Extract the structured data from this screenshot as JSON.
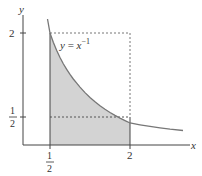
{
  "figure": {
    "axes": {
      "x_label": "x",
      "y_label": "y"
    },
    "curve": {
      "equation_lhs": "y",
      "equation_eq": " = ",
      "equation_base": "x",
      "equation_exp": "−1",
      "function": "y = 1/x",
      "domain": [
        0.45,
        3.0
      ]
    },
    "shaded_region": {
      "x_from": 0.5,
      "x_to": 2,
      "description": "area under y = 1/x from x = 1/2 to x = 2"
    },
    "dashed_rectangle": {
      "x_from": 0.5,
      "x_to": 2,
      "y_top": 2,
      "y_mid": 0.5
    },
    "x_ticks": [
      {
        "value": 0.5,
        "num": "1",
        "den": "2"
      },
      {
        "value": 2,
        "label": "2"
      }
    ],
    "y_ticks": [
      {
        "value": 2,
        "label": "2"
      },
      {
        "value": 0.5,
        "num": "1",
        "den": "2"
      }
    ],
    "colors": {
      "axis": "#444444",
      "curve": "#777777",
      "shade": "#d3d3d3",
      "dash": "#777777",
      "text": "#333333"
    }
  }
}
